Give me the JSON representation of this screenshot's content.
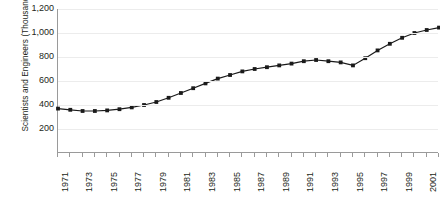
{
  "chart_data": {
    "type": "line",
    "title": "",
    "xlabel": "",
    "ylabel": "Scientists and Engineers (Thousands)",
    "ylim": [
      0,
      1200
    ],
    "xlim": [
      1971,
      2002
    ],
    "grid": true,
    "legend": "none",
    "marker": "square",
    "line_color": "#1a1a1a",
    "marker_color": "#1a1a1a",
    "gridline_color": "#ececec",
    "axis_color": "#9a9a9a",
    "y_ticks": [
      "200",
      "400",
      "600",
      "800",
      "1,000",
      "1,200"
    ],
    "y_tick_values": [
      200,
      400,
      600,
      800,
      1000,
      1200
    ],
    "x_tick_labels": [
      "1971",
      "1973",
      "1975",
      "1977",
      "1979",
      "1981",
      "1983",
      "1985",
      "1987",
      "1989",
      "1991",
      "1993",
      "1995",
      "1997",
      "1999",
      "2001"
    ],
    "x": [
      1971,
      1972,
      1973,
      1974,
      1975,
      1976,
      1977,
      1978,
      1979,
      1980,
      1981,
      1982,
      1983,
      1984,
      1985,
      1986,
      1987,
      1988,
      1989,
      1990,
      1991,
      1992,
      1993,
      1994,
      1995,
      1996,
      1997,
      1998,
      1999,
      2000,
      2001,
      2002
    ],
    "values": [
      370,
      360,
      350,
      350,
      355,
      365,
      380,
      400,
      425,
      460,
      500,
      540,
      580,
      620,
      650,
      680,
      700,
      715,
      730,
      745,
      765,
      775,
      765,
      755,
      730,
      790,
      855,
      910,
      960,
      1000,
      1025,
      1045
    ]
  }
}
